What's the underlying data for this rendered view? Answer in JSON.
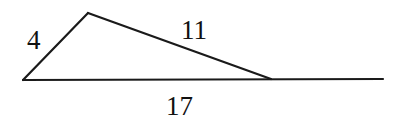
{
  "diagram": {
    "type": "triangle-on-line",
    "vertices": {
      "left": {
        "x": 23,
        "y": 80
      },
      "top": {
        "x": 88,
        "y": 13
      },
      "right": {
        "x": 271,
        "y": 79
      }
    },
    "baseline_end": {
      "x": 383,
      "y": 79
    },
    "labels": {
      "left_side": "4",
      "top_side": "11",
      "base": "17"
    },
    "colors": {
      "stroke": "#1a1a1a",
      "text": "#111111",
      "background": "#ffffff"
    }
  }
}
